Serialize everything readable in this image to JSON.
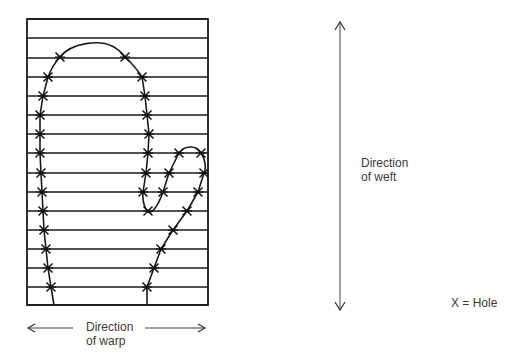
{
  "diagram": {
    "type": "mitten-on-weft-grid",
    "grid": {
      "left": 27,
      "right": 208,
      "top": 19,
      "bottom": 305,
      "line_y": [
        19,
        38,
        58,
        77,
        96,
        115,
        134,
        153,
        173,
        192,
        211,
        230,
        249,
        268,
        287,
        305
      ],
      "line_color": "#1a1a1a"
    },
    "outline": {
      "main_path": "M54,305 L51,287 L48,268 L46,249 L44,230 L43,211 L42,192 L41,173 L40,153 L40,134 L40,115 L43,96 L48,77 Q52,66 60,57 C72,42 100,40 112,46 C118,49 122,53 125,57 Q135,66 142,77 L145,96 L147,115 L149,134 L148,153 L146,173 L143,192 Q142,205 148,212 C152,214 158,206 163,192 L169,173 L179,153 C184,146 196,144 201,153 C206,160 206,170 204,173 L198,192 L187,211 L173,230 L161,249 L154,268 L147,287 L147,305",
      "stroke": "#1a1a1a"
    },
    "holes": [
      [
        60,
        57
      ],
      [
        125,
        57
      ],
      [
        48,
        77
      ],
      [
        142,
        77
      ],
      [
        43,
        96
      ],
      [
        145,
        96
      ],
      [
        40,
        115
      ],
      [
        147,
        115
      ],
      [
        40,
        134
      ],
      [
        149,
        134
      ],
      [
        40,
        153
      ],
      [
        148,
        153
      ],
      [
        179,
        153
      ],
      [
        201,
        153
      ],
      [
        41,
        173
      ],
      [
        146,
        173
      ],
      [
        169,
        173
      ],
      [
        204,
        173
      ],
      [
        42,
        192
      ],
      [
        143,
        192
      ],
      [
        163,
        192
      ],
      [
        198,
        192
      ],
      [
        43,
        211
      ],
      [
        148,
        211
      ],
      [
        187,
        211
      ],
      [
        44,
        230
      ],
      [
        173,
        230
      ],
      [
        46,
        249
      ],
      [
        161,
        249
      ],
      [
        48,
        268
      ],
      [
        154,
        268
      ],
      [
        51,
        287
      ],
      [
        147,
        287
      ]
    ],
    "weft_arrow": {
      "x": 340,
      "y1": 22,
      "y2": 310
    },
    "warp_arrow": {
      "y": 328,
      "left_x1": 28,
      "left_x2": 73,
      "right_x1": 145,
      "right_x2": 205
    }
  },
  "labels": {
    "weft_line1": "Direction",
    "weft_line2": "of weft",
    "warp_line1": "Direction",
    "warp_line2": "of warp",
    "legend": "X = Hole"
  }
}
